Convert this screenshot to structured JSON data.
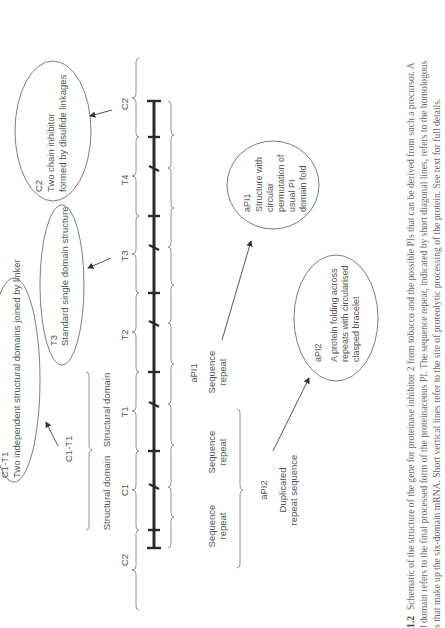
{
  "figure": {
    "orientation": "rotated-90-ccw",
    "gene_bar": {
      "segment_labels": [
        "C2",
        "T4",
        "T3",
        "T2",
        "T1",
        "C1",
        "C2"
      ],
      "processing_sites_note": "vertical ticks",
      "repeat_boundaries_note": "diagonal ticks"
    },
    "ellipses": {
      "c2": {
        "title": "C2",
        "line1": "Two chain inhibitor",
        "line2": "formed by disulfide linkages"
      },
      "t3": {
        "title": "T3",
        "line1": "Standard single domain structure"
      },
      "c1t1": {
        "title": "C1-T1",
        "line1": "Two independent structural domains joined by linker"
      },
      "api1": {
        "title": "aPI1",
        "line1": "Structure with",
        "line2": "circular",
        "line3": "permutation of",
        "line4": "usual PI",
        "line5": "domain fold"
      },
      "api2": {
        "title": "aPI2",
        "line1": "A protein folding across",
        "line2": "repeats with circularised",
        "line3": "clasped bracelet"
      }
    },
    "labels": {
      "c1t1_pointer": "C1-T1",
      "structural_domain_1": "Structural domain",
      "structural_domain_2": "Structural domain",
      "api1_label": "aPI1",
      "seq_repeat_upper": {
        "line1": "Sequence",
        "line2": "repeat"
      },
      "seq_repeat_mid": {
        "line1": "Sequence",
        "line2": "repeat"
      },
      "seq_repeat_lower": {
        "line1": "Sequence",
        "line2": "repeat"
      },
      "api2_label": "aPI2",
      "duplicated": {
        "line1": "Duplicated",
        "line2": "repeat sequence"
      }
    }
  },
  "caption": {
    "label": "1.2",
    "line1": "Schematic of the structure of the gene for proteinase inhibitor 2 from tobacco and the possible PIs that can be derived from such a precursor. A",
    "line2": "l domain refers to the final processed form of the proteinaceous PI. The sequence repeat, indicated by short diagonal lines, refers to the homologous",
    "line3": "s that make up the six-domain mRNA. Short vertical lines refer to the site of proteolytic processing of the protein. See text for full details."
  }
}
